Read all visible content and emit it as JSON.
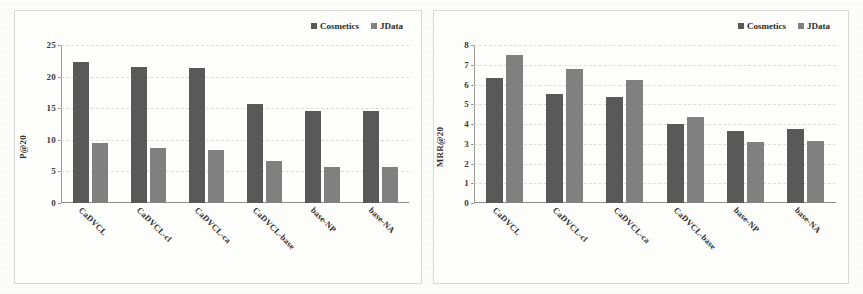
{
  "figure": {
    "background_color": "#fcfcfb",
    "panel_border_color": "#d8d8d4"
  },
  "legend": {
    "series": [
      {
        "label": "Cosmetics",
        "color": "#595959"
      },
      {
        "label": "JData",
        "color": "#808080"
      }
    ]
  },
  "chart_data": [
    {
      "type": "bar",
      "title": "",
      "xlabel": "",
      "ylabel": "P@20",
      "ylim": [
        0,
        25
      ],
      "yticks": [
        0,
        5,
        10,
        15,
        20,
        25
      ],
      "grid": true,
      "legend_position": "top-right",
      "categories": [
        "CaDVCL",
        "CaDVCL-cl",
        "CaDVCL-ca",
        "CaDVCL-base",
        "base-NP",
        "base-NA"
      ],
      "series": [
        {
          "name": "Cosmetics",
          "color": "#595959",
          "values": [
            22.3,
            21.6,
            21.4,
            15.6,
            14.5,
            14.6
          ]
        },
        {
          "name": "JData",
          "color": "#808080",
          "values": [
            9.5,
            8.7,
            8.4,
            6.6,
            5.7,
            5.7
          ]
        }
      ]
    },
    {
      "type": "bar",
      "title": "",
      "xlabel": "",
      "ylabel": "MRR@20",
      "ylim": [
        0,
        8
      ],
      "yticks": [
        0,
        1,
        2,
        3,
        4,
        5,
        6,
        7,
        8
      ],
      "grid": true,
      "legend_position": "top-right",
      "categories": [
        "CaDVCL",
        "CaDVCL-cl",
        "CaDVCL-ca",
        "CaDVCL-base",
        "base-NP",
        "base-NA"
      ],
      "series": [
        {
          "name": "Cosmetics",
          "color": "#595959",
          "values": [
            6.35,
            5.5,
            5.35,
            4.0,
            3.65,
            3.75
          ]
        },
        {
          "name": "JData",
          "color": "#808080",
          "values": [
            7.5,
            6.8,
            6.25,
            4.35,
            3.1,
            3.15
          ]
        }
      ]
    }
  ]
}
